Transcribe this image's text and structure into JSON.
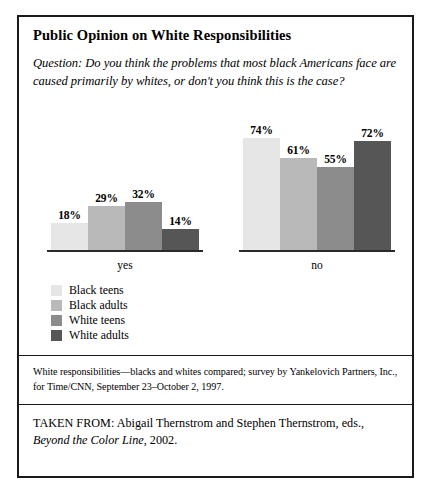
{
  "figure": {
    "title": "Public Opinion on White Responsibilities",
    "question": "Question: Do you think the problems that most black Americans face are caused primarily by whites, or don't you think this is the case?",
    "source_note": "White responsibilities—blacks and whites compared; survey by Yankelovich Partners, Inc., for Time/CNN, September 23–October 2, 1997.",
    "taken_from_prefix": "TAKEN FROM: Abigail Thernstrom and Stephen Thernstrom, eds.,",
    "taken_from_title": "Beyond the Color Line",
    "taken_from_year": ", 2002."
  },
  "chart_data": {
    "type": "bar",
    "title": "Public Opinion on White Responsibilities",
    "xlabel": "",
    "ylabel": "",
    "ylim": [
      0,
      100
    ],
    "grid": false,
    "legend_position": "below-left",
    "categories": [
      "yes",
      "no"
    ],
    "series": [
      {
        "name": "Black teens",
        "color": "#e6e6e6",
        "values": [
          18,
          74
        ],
        "labels": [
          "18%",
          "74%"
        ]
      },
      {
        "name": "Black adults",
        "color": "#b9b9b9",
        "values": [
          29,
          61
        ],
        "labels": [
          "29%",
          "61%"
        ]
      },
      {
        "name": "White teens",
        "color": "#8c8c8c",
        "values": [
          32,
          55
        ],
        "labels": [
          "32%",
          "55%"
        ]
      },
      {
        "name": "White adults",
        "color": "#565656",
        "values": [
          14,
          72
        ],
        "labels": [
          "14%",
          "72%"
        ]
      }
    ],
    "annotations": [
      "Values shown as data labels above each bar."
    ]
  }
}
